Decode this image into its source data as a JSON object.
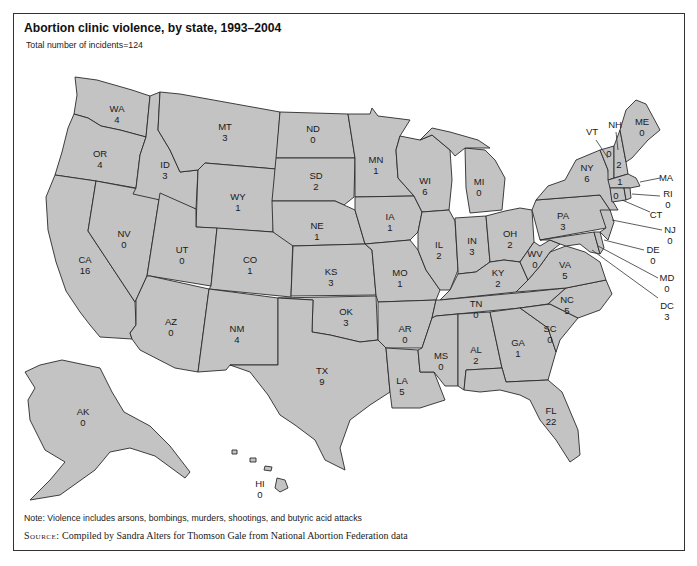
{
  "figure": {
    "title": "Abortion clinic violence, by state, 1993–2004",
    "subtitle": "Total number of incidents=124",
    "note": "Note: Violence includes arsons, bombings, murders, shootings, and butyric acid attacks",
    "source_keyword": "Source:",
    "source_text": " Compiled by Sandra Alters for Thomson Gale from National Abortion Federation data"
  },
  "colors": {
    "state_fill": "#c3c3c3",
    "state_border": "#2a2a2a",
    "frame": "#333333",
    "text": "#1a1a1a"
  },
  "states": {
    "WA": {
      "abbr": "WA",
      "value": "4"
    },
    "OR": {
      "abbr": "OR",
      "value": "4"
    },
    "CA": {
      "abbr": "CA",
      "value": "16"
    },
    "NV": {
      "abbr": "NV",
      "value": "0"
    },
    "ID": {
      "abbr": "ID",
      "value": "3"
    },
    "MT": {
      "abbr": "MT",
      "value": "3"
    },
    "WY": {
      "abbr": "WY",
      "value": "1"
    },
    "UT": {
      "abbr": "UT",
      "value": "0"
    },
    "CO": {
      "abbr": "CO",
      "value": "1"
    },
    "AZ": {
      "abbr": "AZ",
      "value": "0"
    },
    "NM": {
      "abbr": "NM",
      "value": "4"
    },
    "ND": {
      "abbr": "ND",
      "value": "0"
    },
    "SD": {
      "abbr": "SD",
      "value": "2"
    },
    "NE": {
      "abbr": "NE",
      "value": "1"
    },
    "KS": {
      "abbr": "KS",
      "value": "3"
    },
    "OK": {
      "abbr": "OK",
      "value": "3"
    },
    "TX": {
      "abbr": "TX",
      "value": "9"
    },
    "MN": {
      "abbr": "MN",
      "value": "1"
    },
    "IA": {
      "abbr": "IA",
      "value": "1"
    },
    "MO": {
      "abbr": "MO",
      "value": "1"
    },
    "AR": {
      "abbr": "AR",
      "value": "0"
    },
    "LA": {
      "abbr": "LA",
      "value": "5"
    },
    "WI": {
      "abbr": "WI",
      "value": "6"
    },
    "IL": {
      "abbr": "IL",
      "value": "2"
    },
    "MI": {
      "abbr": "MI",
      "value": "0"
    },
    "IN": {
      "abbr": "IN",
      "value": "3"
    },
    "OH": {
      "abbr": "OH",
      "value": "2"
    },
    "KY": {
      "abbr": "KY",
      "value": "2"
    },
    "TN": {
      "abbr": "TN",
      "value": "0"
    },
    "MS": {
      "abbr": "MS",
      "value": "0"
    },
    "AL": {
      "abbr": "AL",
      "value": "2"
    },
    "GA": {
      "abbr": "GA",
      "value": "1"
    },
    "FL": {
      "abbr": "FL",
      "value": "22"
    },
    "SC": {
      "abbr": "SC",
      "value": "0"
    },
    "NC": {
      "abbr": "NC",
      "value": "5"
    },
    "VA": {
      "abbr": "VA",
      "value": "5"
    },
    "WV": {
      "abbr": "WV",
      "value": "0"
    },
    "PA": {
      "abbr": "PA",
      "value": "3"
    },
    "NY": {
      "abbr": "NY",
      "value": "6"
    },
    "VT": {
      "abbr": "VT",
      "value": "0"
    },
    "NH": {
      "abbr": "NH",
      "value": "2"
    },
    "ME": {
      "abbr": "ME",
      "value": "0"
    },
    "MA": {
      "abbr": "MA",
      "value": "1"
    },
    "RI": {
      "abbr": "RI",
      "value": "0"
    },
    "CT": {
      "abbr": "CT",
      "value": "0"
    },
    "NJ": {
      "abbr": "NJ",
      "value": "0"
    },
    "DE": {
      "abbr": "DE",
      "value": "0"
    },
    "MD": {
      "abbr": "MD",
      "value": "0"
    },
    "DC": {
      "abbr": "DC",
      "value": "3"
    },
    "AK": {
      "abbr": "AK",
      "value": "0"
    },
    "HI": {
      "abbr": "HI",
      "value": "0"
    }
  }
}
